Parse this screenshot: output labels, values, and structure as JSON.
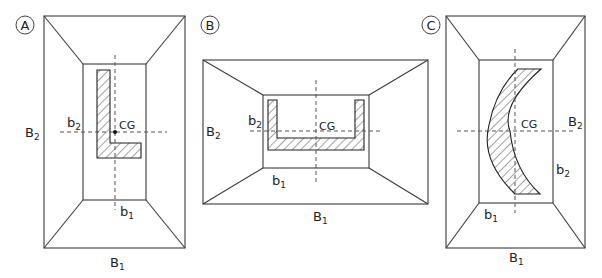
{
  "figure": {
    "panels": [
      {
        "id": "A",
        "badge": "A",
        "section_shape": "L-shaped angle",
        "labels": {
          "B1": "B",
          "B1_sub": "1",
          "B2": "B",
          "B2_sub": "2",
          "b1": "b",
          "b1_sub": "1",
          "b2": "b",
          "b2_sub": "2",
          "cg": "CG"
        }
      },
      {
        "id": "B",
        "badge": "B",
        "section_shape": "channel (U-shaped)",
        "labels": {
          "B1": "B",
          "B1_sub": "1",
          "B2": "B",
          "B2_sub": "2",
          "b1": "b",
          "b1_sub": "1",
          "b2": "b",
          "b2_sub": "2",
          "cg": "CG"
        }
      },
      {
        "id": "C",
        "badge": "C",
        "section_shape": "crescent (curved)",
        "labels": {
          "B1": "B",
          "B1_sub": "1",
          "B2": "B",
          "B2_sub": "2",
          "b1": "b",
          "b1_sub": "1",
          "b2": "b",
          "b2_sub": "2",
          "cg": "CG"
        }
      }
    ]
  }
}
